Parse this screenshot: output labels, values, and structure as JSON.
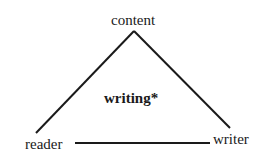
{
  "diagram": {
    "type": "triangle",
    "nodes": {
      "top": "content",
      "bottom_left": "reader",
      "bottom_right": "writer"
    },
    "center_label": "writing*",
    "edges": [
      {
        "from": "content",
        "to": "reader"
      },
      {
        "from": "content",
        "to": "writer"
      },
      {
        "from": "reader",
        "to": "writer"
      }
    ],
    "colors": {
      "line": "#1a1a1a",
      "text": "#1a1a1a",
      "background": "#ffffff"
    }
  }
}
